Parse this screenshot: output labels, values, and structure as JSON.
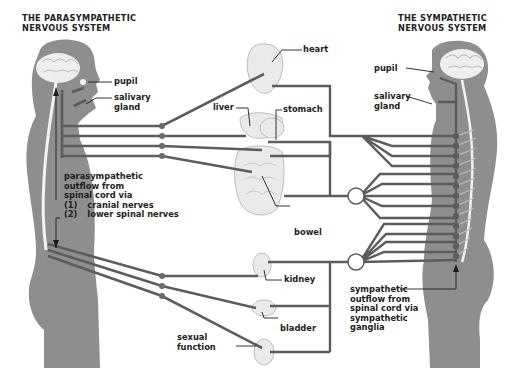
{
  "titles": {
    "parasympathetic": [
      "THE PARASYMPATHETIC",
      "NERVOUS SYSTEM"
    ],
    "sympathetic": [
      "THE SYMPATHETIC",
      "NERVOUS SYSTEM"
    ]
  },
  "left_labels": {
    "pupil": "pupil",
    "salivary_gland": [
      "salivary",
      "gland"
    ],
    "outflow": [
      "parasympathetic",
      "outflow from",
      "spinal cord via"
    ],
    "outflow_items": [
      {
        "num": "(1)",
        "text": "cranial nerves"
      },
      {
        "num": "(2)",
        "text": "lower spinal nerves"
      }
    ]
  },
  "organ_labels": {
    "heart": "heart",
    "liver": "liver",
    "stomach": "stomach",
    "bowel": "bowel",
    "kidney": "kidney",
    "bladder": "bladder",
    "sexual_function": [
      "sexual",
      "function"
    ]
  },
  "right_labels": {
    "pupil": "pupil",
    "salivary_gland": [
      "salivary",
      "gland"
    ],
    "outflow": [
      "sympathetic",
      "outflow from",
      "spinal cord via",
      "sympathetic",
      "ganglia"
    ]
  },
  "colors": {
    "body": "#8e8e8e",
    "nerve": "#5c5c5c",
    "spine": "#e8e8e8",
    "text": "#1d1d1d"
  }
}
